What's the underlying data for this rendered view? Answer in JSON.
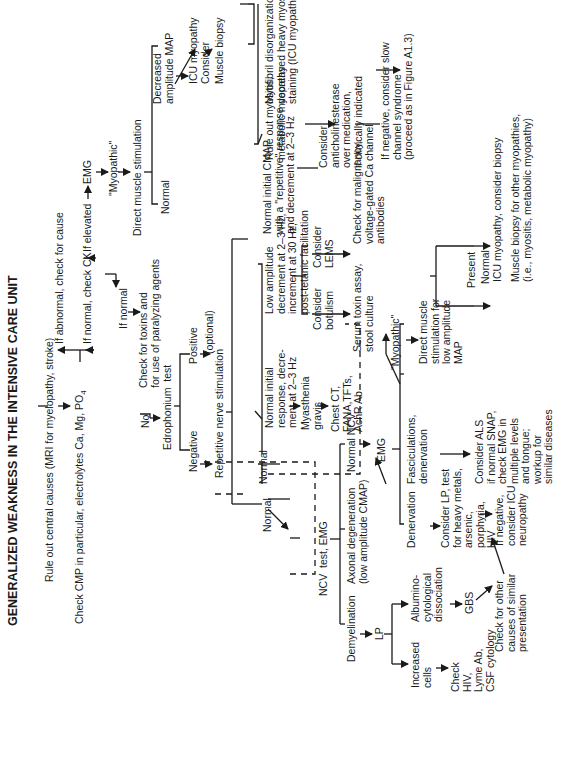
{
  "title": "GENERALIZED WEAKNESS IN THE INTENSIVE CARE UNIT",
  "nodes": {
    "rule_out": "Rule out central causes (MRI for myelopathy, stroke)",
    "check_cmp": "Check CMP in particular, electrolytes Ca, Mg, PO",
    "check_cmp_sub": "4",
    "if_abnormal": "If abnormal, check for cause",
    "if_normal_ck": "If normal, check CK",
    "if_elevated": "If elevated",
    "emg_top": "EMG",
    "myopathic_top": "\"Myopathic\"",
    "direct_muscle_stim": "Direct muscle stimulation",
    "normal_dms": "Normal",
    "decreased_map": "Decreased\namplitude MAP",
    "icu_myopathy_consider": "ICU myopathy\nConsider",
    "muscle_biopsy": "Muscle biopsy",
    "rule_out_myositis": "Rule out myositis,\nmetabolic myopathy",
    "myofibril": "Myofibril disorganization,\ndecreased heavy myosin\nstaining (ICU myopathy)",
    "if_normal": "If normal",
    "check_toxins": "Check for toxins and\nfor use of paralyzing agents",
    "no": "No",
    "edrophonium": "Edrophonium  test",
    "positive": "Positive",
    "optional": "(optional)",
    "negative": "Negative",
    "rns": "Repetitive nerve stimulation",
    "normal_rns": "Normal",
    "normal_rns2": "Normal",
    "ncv_emg": "NCV  test, EMG",
    "normal_initial_decrement": "Normal initial\nresponse, decre-\nment at 2–3 Hz",
    "low_amplitude": "Low amplitude\ndecrement at 2–3 Hz,\nincrement at 30 Hz,\npost-tetanic facilitation",
    "normal_initial_cmap": "Normal initial CMAP\nwith a \"repetitive\" response\nand decrement at 2–3 Hz",
    "consider_anticholinesterase": "Consider\nanticholinesterase\nover medication,\nif clinically indicated",
    "slow_channel": "If negative, consider slow\nchannel syndrome\n(proceed as in Figure A1.3)",
    "myasthenia": "Myasthenia\ngravis",
    "chest_ct": "Chest CT,\nFANA,TFTs,\nAchR Ab",
    "consider_botulism": "Consider\nbotulism",
    "consider_lems": "Consider\nLEMS",
    "serum_toxin": "Serum toxin assay,\nstool culture",
    "check_malignancy": "Check for malignancy,\nvoltage-gated Ca channel\nantibodies",
    "myopathic_mid": "\"Myopathic\"",
    "direct_muscle_low": "Direct muscle\nstimulation for\nlow amplitude\nMAP",
    "present": "Present",
    "normal_dm": "Normal",
    "icu_consider_biopsy": "ICU myopathy, consider biopsy",
    "muscle_biopsy_other": "Muscle biopsy for other myopathies,\n(i.e., myositis, metabolic myopathy)",
    "demyelination": "Demyelination",
    "axonal": "Axonal degeneration\n(low amplitude CMAP)",
    "normal_ncv": "Normal NCV",
    "emg_mid": "EMG",
    "denervation": "Denervation",
    "fasciculations": "Fasciculations,\ndenervation",
    "consider_lp": "Consider LP, test\nfor heavy metals,\narsenic,\nporphyria,\nHIV",
    "consider_als": "Consider ALS\nif normal SNAP,\ncheck EMG in\nmultiple levels\nand tongue;\nworkup for\nsimilar diseases",
    "icu_neuropathy": "If negative,\nconsider ICU\nneuropathy",
    "lp": "LP",
    "increased_cells": "Increased\ncells",
    "albumino": "Albumino-\ncytological\ndissociation",
    "check_hiv": "Check\nHIV,\nLyme Ab,\nCSF cytology",
    "gbs": "GBS",
    "check_other": "Check for other\ncauses of similar\npresentation"
  }
}
